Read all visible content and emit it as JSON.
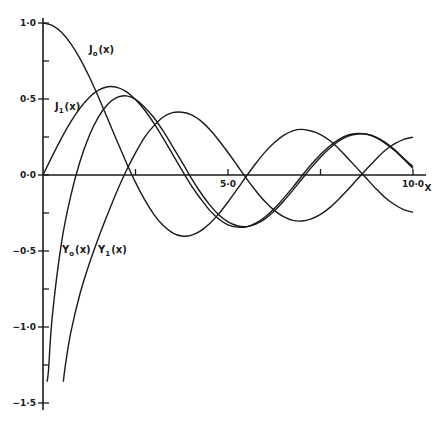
{
  "chart_data": {
    "type": "line",
    "title": "",
    "xlabel": "X",
    "ylabel": "",
    "xlim": [
      0,
      10
    ],
    "ylim": [
      -1.5,
      1.0
    ],
    "grid": false,
    "legend": "inline curve labels",
    "x_ticks": [
      {
        "value": 2.5,
        "label": ""
      },
      {
        "value": 5.0,
        "label": "5·0"
      },
      {
        "value": 7.5,
        "label": ""
      },
      {
        "value": 10.0,
        "label": "10·0"
      }
    ],
    "y_ticks": [
      {
        "value": 1.0,
        "label": "1·0"
      },
      {
        "value": 0.75,
        "label": ""
      },
      {
        "value": 0.5,
        "label": "0·5"
      },
      {
        "value": 0.25,
        "label": ""
      },
      {
        "value": 0.0,
        "label": "0·0"
      },
      {
        "value": -0.25,
        "label": ""
      },
      {
        "value": -0.5,
        "label": "−0·5"
      },
      {
        "value": -0.75,
        "label": ""
      },
      {
        "value": -1.0,
        "label": "−1·0"
      },
      {
        "value": -1.25,
        "label": ""
      },
      {
        "value": -1.5,
        "label": "−1·5"
      }
    ],
    "series": [
      {
        "name": "J0(x)",
        "label_main": "J",
        "label_sub": "o",
        "label_tail": "(x)",
        "label_pos": [
          89,
          53
        ],
        "x": [
          0,
          0.25,
          0.5,
          0.75,
          1,
          1.25,
          1.5,
          1.75,
          2,
          2.25,
          2.5,
          2.75,
          3,
          3.25,
          3.5,
          3.75,
          4,
          4.25,
          4.5,
          4.75,
          5,
          5.25,
          5.5,
          5.75,
          6,
          6.25,
          6.5,
          6.75,
          7,
          7.25,
          7.5,
          7.75,
          8,
          8.25,
          8.5,
          8.75,
          9,
          9.25,
          9.5,
          9.75,
          10
        ],
        "y": [
          1,
          0.9844,
          0.9385,
          0.8642,
          0.7652,
          0.6459,
          0.5118,
          0.369,
          0.2239,
          0.0827,
          -0.0484,
          -0.1641,
          -0.2601,
          -0.3328,
          -0.3801,
          -0.4014,
          -0.3971,
          -0.369,
          -0.3205,
          -0.256,
          -0.1776,
          -0.0931,
          -0.0068,
          0.076,
          0.1506,
          0.2118,
          0.2601,
          0.2906,
          0.3001,
          0.2892,
          0.2663,
          0.2266,
          0.1717,
          0.1074,
          0.0419,
          -0.025,
          -0.0903,
          -0.1491,
          -0.1939,
          -0.2277,
          -0.2459
        ]
      },
      {
        "name": "J1(x)",
        "label_main": "J",
        "label_sub": "1",
        "label_tail": "(x)",
        "label_pos": [
          55,
          110
        ],
        "x": [
          0,
          0.25,
          0.5,
          0.75,
          1,
          1.25,
          1.5,
          1.75,
          2,
          2.25,
          2.5,
          2.75,
          3,
          3.25,
          3.5,
          3.75,
          4,
          4.25,
          4.5,
          4.75,
          5,
          5.25,
          5.5,
          5.75,
          6,
          6.25,
          6.5,
          6.75,
          7,
          7.25,
          7.5,
          7.75,
          8,
          8.25,
          8.5,
          8.75,
          9,
          9.25,
          9.5,
          9.75,
          10
        ],
        "y": [
          0,
          0.124,
          0.2423,
          0.3492,
          0.4401,
          0.5106,
          0.5579,
          0.5802,
          0.5767,
          0.5484,
          0.4971,
          0.426,
          0.3391,
          0.2411,
          0.1374,
          0.0334,
          -0.066,
          -0.1528,
          -0.2311,
          -0.2892,
          -0.3276,
          -0.3432,
          -0.3414,
          -0.317,
          -0.2767,
          -0.2209,
          -0.1538,
          -0.0811,
          -0.0047,
          0.0696,
          0.1352,
          0.1911,
          0.2346,
          0.2634,
          0.2731,
          0.2684,
          0.2453,
          0.2079,
          0.1613,
          0.1043,
          0.0435
        ]
      },
      {
        "name": "Y0(x)",
        "label_main": "Y",
        "label_sub": "o",
        "label_tail": "(x)",
        "label_pos": [
          62,
          253
        ],
        "x": [
          0.11,
          0.15,
          0.25,
          0.5,
          0.75,
          1,
          1.25,
          1.5,
          1.75,
          2,
          2.25,
          2.5,
          2.75,
          3,
          3.25,
          3.5,
          3.75,
          4,
          4.25,
          4.5,
          4.75,
          5,
          5.25,
          5.5,
          5.75,
          6,
          6.25,
          6.5,
          6.75,
          7,
          7.25,
          7.5,
          7.75,
          8,
          8.25,
          8.5,
          8.75,
          9,
          9.25,
          9.5,
          9.75,
          10
        ],
        "y": [
          -1.36,
          -1.28,
          -0.9316,
          -0.4445,
          -0.1372,
          0.0883,
          0.2582,
          0.3824,
          0.4649,
          0.5104,
          0.5208,
          0.4981,
          0.4443,
          0.3769,
          0.2882,
          0.189,
          0.0875,
          -0.0169,
          -0.1119,
          -0.1947,
          -0.261,
          -0.3085,
          -0.3339,
          -0.3395,
          -0.3227,
          -0.2882,
          -0.2363,
          -0.1732,
          -0.1011,
          -0.0259,
          0.0485,
          0.1173,
          0.1759,
          0.2235,
          0.2555,
          0.2702,
          0.2688,
          0.2499,
          0.2149,
          0.1672,
          0.1103,
          0.0557
        ]
      },
      {
        "name": "Y1(x)",
        "label_main": "Y",
        "label_sub": "1",
        "label_tail": "(x)",
        "label_pos": [
          98,
          253
        ],
        "x": [
          0.55,
          0.6,
          0.75,
          1,
          1.25,
          1.5,
          1.75,
          2,
          2.25,
          2.5,
          2.75,
          3,
          3.25,
          3.5,
          3.75,
          4,
          4.25,
          4.5,
          4.75,
          5,
          5.25,
          5.5,
          5.75,
          6,
          6.25,
          6.5,
          6.75,
          7,
          7.25,
          7.5,
          7.75,
          8,
          8.25,
          8.5,
          8.75,
          9,
          9.25,
          9.5,
          9.75,
          10
        ],
        "y": [
          -1.36,
          -1.2604,
          -1.0376,
          -0.7812,
          -0.5844,
          -0.4123,
          -0.2561,
          -0.107,
          0.0275,
          0.1459,
          0.2497,
          0.3247,
          0.3816,
          0.4102,
          0.4133,
          0.3979,
          0.3596,
          0.301,
          0.229,
          0.1479,
          0.0626,
          -0.0238,
          -0.1032,
          -0.175,
          -0.2327,
          -0.2741,
          -0.2981,
          -0.3027,
          -0.2884,
          -0.2591,
          -0.2147,
          -0.1581,
          -0.0939,
          -0.0262,
          0.0399,
          0.1043,
          0.1633,
          0.2043,
          0.234,
          0.249
        ]
      }
    ]
  },
  "style": {
    "line_color": "#1a1a1a",
    "background": "#ffffff"
  }
}
